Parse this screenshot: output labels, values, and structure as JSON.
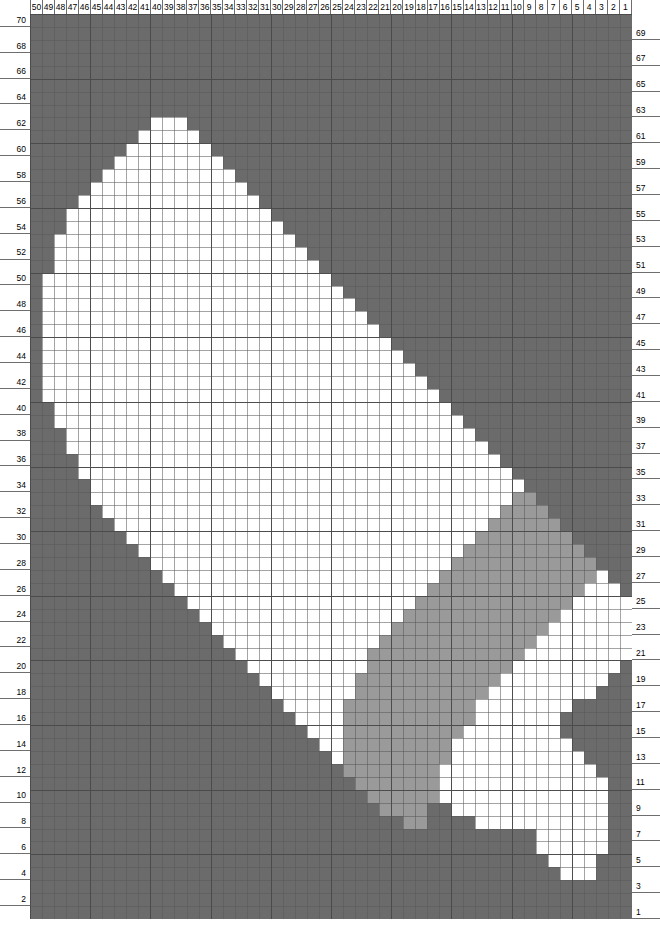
{
  "chart_data": {
    "type": "heatmap",
    "title": "",
    "xlabel": "",
    "ylabel": "",
    "grid": true,
    "columns": 50,
    "rows": 70,
    "column_order": "right-to-left",
    "column_labels": [
      50,
      49,
      48,
      47,
      46,
      45,
      44,
      43,
      42,
      41,
      40,
      39,
      38,
      37,
      36,
      35,
      34,
      33,
      32,
      31,
      30,
      29,
      28,
      27,
      26,
      25,
      24,
      23,
      22,
      21,
      20,
      19,
      18,
      17,
      16,
      15,
      14,
      13,
      12,
      11,
      10,
      9,
      8,
      7,
      6,
      5,
      4,
      3,
      2,
      1
    ],
    "row_labels_left": [
      70,
      68,
      66,
      64,
      62,
      60,
      58,
      56,
      54,
      52,
      50,
      48,
      46,
      44,
      42,
      40,
      38,
      36,
      34,
      32,
      30,
      28,
      26,
      24,
      22,
      20,
      18,
      16,
      14,
      12,
      10,
      8,
      6,
      4,
      2
    ],
    "row_labels_right": [
      69,
      67,
      65,
      63,
      61,
      59,
      57,
      55,
      53,
      51,
      49,
      47,
      45,
      43,
      41,
      39,
      37,
      35,
      33,
      31,
      29,
      27,
      25,
      23,
      21,
      19,
      17,
      15,
      13,
      11,
      9,
      7,
      5,
      3,
      1
    ],
    "legend": [
      {
        "key": "0",
        "name": "background",
        "color": "#6b6b6b"
      },
      {
        "key": "1",
        "name": "shade-medium",
        "color": "#9a9a9a"
      },
      {
        "key": "2",
        "name": "shade-light",
        "color": "#ffffff"
      }
    ],
    "gridline_color": "#5a5a5a",
    "cells": [
      "00000000000000000000000000000000000000000000000000",
      "00000000000000000000000000000000000000000000000000",
      "00000000000000000000000000000000000000000000000000",
      "00000000000000000000000000000000000000000000222000",
      "00000000000000000000000000000000000000000002222000",
      "00000000000000000000000000000000000000000022222200",
      "00000000000000000000000000000000000000000022222200",
      "00000000000000000000000000000001100002222222222200",
      "00000000000000000000000000000111100222222222222200",
      "00000000000000000000000000001111112222222222222200",
      "00000000000000000000000000011111112222222222222200",
      "00000000000000000000000000111111112222222222222000",
      "00000000000000000000000002111111111222222222220000",
      "00000000000000000000000022111111111222222222200000",
      "00000000000000000000000222111111111122222222000000",
      "00000000000000000000002222111111111112222222000000",
      "00000000000000000000022222111111111112222222200000",
      "00000000000000000000222222211111111111222222222000",
      "00000000000000000002222222211111111111122222222200",
      "00000000000000000022222222221111111111112222222220",
      "00000000000000000222222222221111111111111222222222",
      "00000000000000002222222222222111111111111122222222",
      "00000000000000022222222222222211111111111112222222",
      "00000000000000222222222222222221111111111111222222",
      "00000000000002222222222222222222111111111111122222",
      "00000000000022222222222222222222211111111111112220",
      "00000000000222222222222222222222221111111111111200",
      "00000000002222222222222222222222222111111111111000",
      "00000000022222222222222222222222222211111111110000",
      "00000000222222222222222222222222222221111111100000",
      "00000002222222222222222222222222222222111111000000",
      "00000022222222222222222222222222222222211110000000",
      "00000222222222222222222222222222222222221100000000",
      "00000222222222222222222222222222222222222000000000",
      "00002222222222222222222222222222222222220000000000",
      "00002222222222222222222222222222222222200000000000",
      "00022222222222222222222222222222222222000000000000",
      "00022222222222222222222222222222222220000000000000",
      "00222222222222222222222222222222222200000000000000",
      "00222222222222222222222222222222222000000000000000",
      "02222222222222222222222222222222220000000000000000",
      "02222222222222222222222222222222200000000000000000",
      "02222222222222222222222222222222000000000000000000",
      "02222222222222222222222222222220000000000000000000",
      "02222222222222222222222222222200000000000000000000",
      "02222222222222222222222222222000000000000000000000",
      "02222222222222222222222222220000000000000000000000",
      "02222222222222222222222222200000000000000000000000",
      "02222222222222222222222222000000000000000000000000",
      "02222222222222222222222220000000000000000000000000",
      "00222222222222222222222200000000000000000000000000",
      "00222222222222222222222000000000000000000000000000",
      "00222222222222222222220000000000000000000000000000",
      "00022222222222222222200000000000000000000000000000",
      "00022222222222222222000000000000000000000000000000",
      "00002222222222222220000000000000000000000000000000",
      "00000222222222222200000000000000000000000000000000",
      "00000022222222222000000000000000000000000000000000",
      "00000002222222220000000000000000000000000000000000",
      "00000000222222200000000000000000000000000000000000",
      "00000000022222000000000000000000000000000000000000",
      "00000000002220000000000000000000000000000000000000",
      "00000000000000000000000000000000000000000000000000",
      "00000000000000000000000000000000000000000000000000",
      "00000000000000000000000000000000000000000000000000",
      "00000000000000000000000000000000000000000000000000",
      "00000000000000000000000000000000000000000000000000",
      "00000000000000000000000000000000000000000000000000",
      "00000000000000000000000000000000000000000000000000",
      "00000000000000000000000000000000000000000000000000"
    ]
  }
}
